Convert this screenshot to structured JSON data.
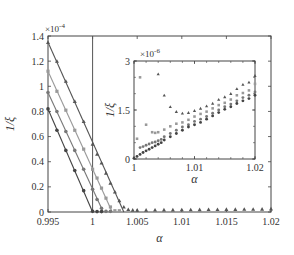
{
  "chart_data": [
    {
      "id": "main",
      "type": "line",
      "title": "",
      "xlabel": "α",
      "ylabel": "1/ξ",
      "y_multiplier": "×10^-4",
      "xlim": [
        0.995,
        1.02
      ],
      "ylim": [
        0,
        1.4
      ],
      "xticks": [
        0.995,
        1,
        1.005,
        1.01,
        1.015,
        1.02
      ],
      "xtick_labels": [
        "0.995",
        "1",
        "1.005",
        "1.01",
        "1.015",
        "1.02"
      ],
      "yticks": [
        0,
        0.2,
        0.4,
        0.6,
        0.8,
        1,
        1.2,
        1.4
      ],
      "ytick_labels": [
        "0",
        "0.2",
        "0.4",
        "0.6",
        "0.8",
        "1",
        "1.2",
        "1.4"
      ],
      "grid": false,
      "vline": 1,
      "series": [
        {
          "name": "series-1",
          "marker": "triangle",
          "color": "#555555",
          "fit": [
            [
              0.995,
              1.35
            ],
            [
              1.0035,
              0
            ]
          ],
          "x": [
            0.995,
            0.996,
            0.997,
            0.998,
            0.999,
            1.0,
            1.0005,
            1.001,
            1.0015,
            1.002,
            1.0025,
            1.003,
            1.0035,
            1.004,
            1.0045,
            1.005,
            1.006,
            1.007,
            1.008,
            1.009,
            1.01,
            1.011,
            1.012,
            1.013,
            1.014,
            1.015,
            1.016,
            1.017,
            1.018,
            1.019,
            1.02
          ],
          "y": [
            1.35,
            1.2,
            1.04,
            0.88,
            0.72,
            0.54,
            0.46,
            0.39,
            0.31,
            0.23,
            0.16,
            0.09,
            0.04,
            0.02,
            0.015,
            0.015,
            0.015,
            0.016,
            0.017,
            0.017,
            0.018,
            0.018,
            0.019,
            0.02,
            0.02,
            0.021,
            0.021,
            0.022,
            0.022,
            0.023,
            0.025
          ]
        },
        {
          "name": "series-2",
          "marker": "square",
          "color": "#999999",
          "fit": [
            [
              0.995,
              1.12
            ],
            [
              1.0022,
              0
            ]
          ],
          "x": [
            0.995,
            0.996,
            0.997,
            0.998,
            0.999,
            1.0,
            1.0005,
            1.001,
            1.0015,
            1.002,
            1.0025,
            1.003
          ],
          "y": [
            1.12,
            0.96,
            0.81,
            0.65,
            0.5,
            0.34,
            0.27,
            0.19,
            0.11,
            0.04,
            0.01,
            0.01
          ]
        },
        {
          "name": "series-3",
          "marker": "circle",
          "color": "#777777",
          "fit": [
            [
              0.995,
              0.95
            ],
            [
              1.0012,
              0
            ]
          ],
          "x": [
            0.995,
            0.996,
            0.997,
            0.998,
            0.999,
            1.0,
            1.0005,
            1.001,
            1.0015,
            1.002
          ],
          "y": [
            0.95,
            0.8,
            0.64,
            0.49,
            0.34,
            0.18,
            0.1,
            0.03,
            0.005,
            0.005
          ]
        },
        {
          "name": "series-4",
          "marker": "circle",
          "color": "#444444",
          "fit": [
            [
              0.995,
              0.82
            ],
            [
              1.0,
              0
            ]
          ],
          "x": [
            0.995,
            0.996,
            0.997,
            0.998,
            0.999,
            1.0,
            1.0005,
            1.001
          ],
          "y": [
            0.82,
            0.65,
            0.49,
            0.33,
            0.17,
            0.005,
            0.003,
            0.003
          ]
        }
      ]
    },
    {
      "id": "inset",
      "type": "scatter",
      "title": "",
      "xlabel": "α",
      "ylabel": "1/ξ",
      "y_multiplier": "×10^-6",
      "xlim": [
        1,
        1.02
      ],
      "ylim": [
        0,
        3
      ],
      "xticks": [
        1,
        1.01,
        1.02
      ],
      "xtick_labels": [
        "1",
        "1.01",
        "1.02"
      ],
      "yticks": [
        0,
        1.5,
        3
      ],
      "ytick_labels": [
        "0",
        "1.5",
        "3"
      ],
      "grid": false,
      "series": [
        {
          "name": "series-1",
          "marker": "triangle",
          "color": "#555555",
          "x": [
            1.004,
            1.005,
            1.006,
            1.007,
            1.008,
            1.009,
            1.01,
            1.011,
            1.012,
            1.013,
            1.014,
            1.015,
            1.016,
            1.017,
            1.018,
            1.019,
            1.02
          ],
          "y": [
            2.6,
            1.95,
            1.6,
            1.45,
            1.4,
            1.42,
            1.48,
            1.55,
            1.62,
            1.7,
            1.82,
            1.9,
            2.0,
            2.15,
            2.28,
            2.35,
            2.55
          ]
        },
        {
          "name": "series-2",
          "marker": "square",
          "color": "#999999",
          "x": [
            1.0005,
            1.001,
            1.002,
            1.003,
            1.0035,
            1.004,
            1.005,
            1.006,
            1.007,
            1.008,
            1.009,
            1.01,
            1.011,
            1.012,
            1.013,
            1.014,
            1.015,
            1.016,
            1.017,
            1.018,
            1.019,
            1.02
          ],
          "y": [
            0.62,
            2.5,
            1.05,
            0.82,
            0.8,
            0.82,
            0.9,
            1.0,
            1.08,
            1.12,
            1.2,
            1.3,
            1.38,
            1.45,
            1.55,
            1.65,
            1.72,
            1.82,
            1.95,
            2.02,
            2.1,
            2.3
          ]
        },
        {
          "name": "series-3",
          "marker": "circle",
          "color": "#777777",
          "x": [
            1.001,
            1.0015,
            1.002,
            1.0025,
            1.003,
            1.0035,
            1.004,
            1.0045,
            1.005,
            1.006,
            1.007,
            1.008,
            1.009,
            1.01,
            1.011,
            1.012,
            1.013,
            1.014,
            1.015,
            1.016,
            1.017,
            1.018,
            1.019,
            1.02
          ],
          "y": [
            0.35,
            0.38,
            0.42,
            0.46,
            0.5,
            0.52,
            0.56,
            0.6,
            0.68,
            0.78,
            0.88,
            0.98,
            1.05,
            1.15,
            1.22,
            1.3,
            1.4,
            1.5,
            1.6,
            1.68,
            1.78,
            1.88,
            1.95,
            2.05
          ]
        },
        {
          "name": "series-4",
          "marker": "circle",
          "color": "#444444",
          "x": [
            1.0,
            1.0005,
            1.001,
            1.0015,
            1.002,
            1.0025,
            1.003,
            1.0035,
            1.004,
            1.0045,
            1.005,
            1.006,
            1.007,
            1.008,
            1.009,
            1.01,
            1.011,
            1.012,
            1.013,
            1.014,
            1.015,
            1.016,
            1.017,
            1.018,
            1.019,
            1.02
          ],
          "y": [
            0.02,
            0.08,
            0.14,
            0.2,
            0.25,
            0.3,
            0.35,
            0.4,
            0.45,
            0.5,
            0.58,
            0.68,
            0.78,
            0.88,
            0.98,
            1.05,
            1.12,
            1.22,
            1.32,
            1.42,
            1.52,
            1.6,
            1.7,
            1.78,
            1.85,
            1.95
          ]
        }
      ]
    }
  ]
}
